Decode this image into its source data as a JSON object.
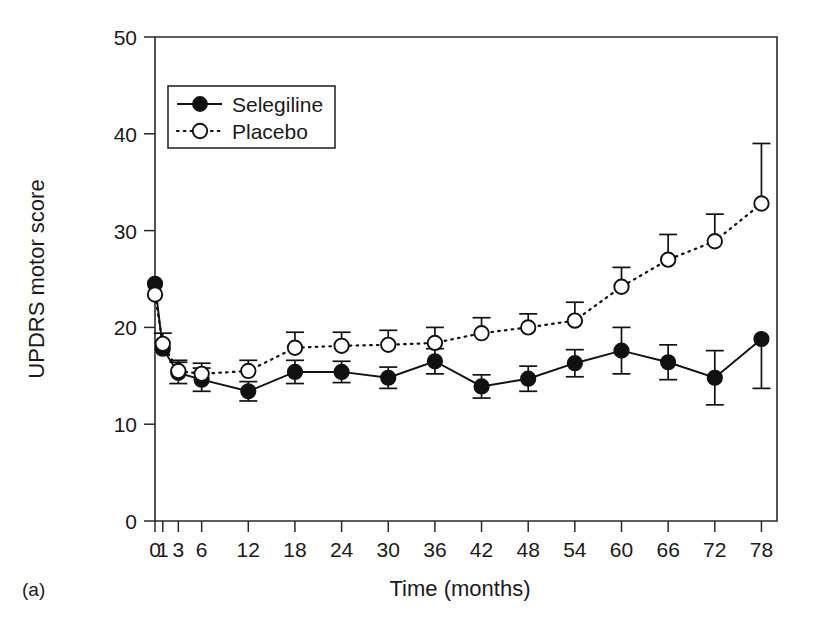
{
  "figure": {
    "panel_label": "(a)",
    "background_color": "#ffffff",
    "ink_color": "#111111"
  },
  "legend": {
    "position": "upper-left-inside",
    "entries": [
      {
        "label": "Selegiline",
        "marker": "filled-circle",
        "line": "solid"
      },
      {
        "label": "Placebo",
        "marker": "open-circle",
        "line": "dotted"
      }
    ]
  },
  "chart_data": {
    "type": "line",
    "title": "",
    "subtitle": "",
    "xlabel": "Time (months)",
    "ylabel": "UPDRS motor score",
    "xlim": [
      0,
      80
    ],
    "ylim": [
      0,
      50
    ],
    "yticks": [
      0,
      10,
      20,
      30,
      40,
      50
    ],
    "ytick_labels": [
      "0",
      "10",
      "20",
      "30",
      "40",
      "50"
    ],
    "xticks": [
      0,
      1,
      3,
      6,
      12,
      18,
      24,
      30,
      36,
      42,
      48,
      54,
      60,
      66,
      72,
      78
    ],
    "xtick_labels": [
      "0",
      "1",
      "3",
      "6",
      "12",
      "18",
      "24",
      "30",
      "36",
      "42",
      "48",
      "54",
      "60",
      "66",
      "72",
      "78"
    ],
    "grid": false,
    "errorbars": "visible",
    "x": [
      0,
      1,
      3,
      6,
      12,
      18,
      24,
      30,
      36,
      42,
      48,
      54,
      60,
      66,
      72,
      78
    ],
    "series": [
      {
        "name": "Selegiline",
        "marker": "filled-circle",
        "line": "solid",
        "color": "#111111",
        "values": [
          24.5,
          17.8,
          15.3,
          14.6,
          13.4,
          15.4,
          15.4,
          14.8,
          16.5,
          13.9,
          14.7,
          16.3,
          17.6,
          16.4,
          14.8,
          18.8
        ],
        "err_low": [
          24.5,
          17.8,
          14.2,
          13.4,
          12.4,
          14.2,
          14.3,
          13.7,
          15.2,
          12.7,
          13.4,
          14.9,
          15.2,
          14.6,
          12.0,
          13.7
        ],
        "err_high": [
          24.5,
          17.8,
          16.4,
          15.8,
          14.4,
          16.6,
          16.5,
          15.9,
          17.8,
          15.1,
          16.0,
          17.7,
          20.0,
          18.2,
          17.6,
          18.8
        ]
      },
      {
        "name": "Placebo",
        "marker": "open-circle",
        "line": "dotted",
        "color": "#111111",
        "values": [
          23.4,
          18.3,
          15.5,
          15.2,
          15.5,
          17.9,
          18.1,
          18.2,
          18.4,
          19.4,
          20.0,
          20.7,
          24.2,
          27.0,
          28.9,
          32.8
        ],
        "err_low": [
          23.4,
          18.3,
          15.5,
          15.2,
          15.5,
          17.9,
          18.1,
          18.2,
          18.4,
          19.4,
          20.0,
          20.7,
          24.2,
          27.0,
          28.9,
          32.8
        ],
        "err_high": [
          23.4,
          19.4,
          16.6,
          16.3,
          16.6,
          19.5,
          19.5,
          19.7,
          20.0,
          21.0,
          21.4,
          22.6,
          26.2,
          29.6,
          31.7,
          39.0
        ]
      }
    ]
  }
}
